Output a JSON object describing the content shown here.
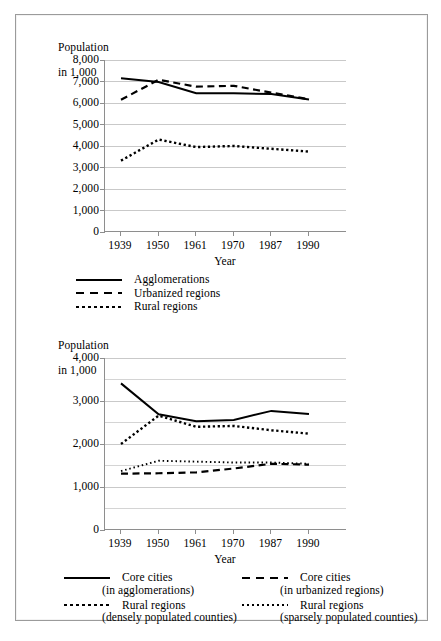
{
  "document": {
    "border_color": "#9b9b9b",
    "background": "#ffffff",
    "ink": "#000000"
  },
  "chart_data": [
    {
      "id": "top",
      "type": "line",
      "title": "",
      "ylabel": "Population\nin 1,000",
      "xlabel": "Year",
      "categories": [
        "1939",
        "1950",
        "1961",
        "1970",
        "1987",
        "1990"
      ],
      "ylim": [
        0,
        8000
      ],
      "yticks": [
        0,
        1000,
        2000,
        3000,
        4000,
        5000,
        6000,
        7000,
        8000
      ],
      "ytick_labels": [
        "0",
        "1,000",
        "2,000",
        "3,000",
        "4,000",
        "5,000",
        "6,000",
        "7,000",
        "8,000"
      ],
      "grid": true,
      "legend_position": "below",
      "series": [
        {
          "name": "Agglomerations",
          "style": "solid",
          "values": [
            7150,
            6980,
            6450,
            6450,
            6420,
            6160
          ]
        },
        {
          "name": "Urbanized regions",
          "style": "dashed",
          "values": [
            6150,
            7080,
            6760,
            6800,
            6480,
            6170
          ]
        },
        {
          "name": "Rural regions",
          "style": "dotted",
          "values": [
            3320,
            4300,
            3950,
            4000,
            3870,
            3740
          ]
        }
      ]
    },
    {
      "id": "bottom",
      "type": "line",
      "title": "",
      "ylabel": "Population\nin 1,000",
      "xlabel": "Year",
      "categories": [
        "1939",
        "1950",
        "1961",
        "1970",
        "1987",
        "1990"
      ],
      "ylim": [
        0,
        4000
      ],
      "yticks": [
        0,
        1000,
        2000,
        3000,
        4000
      ],
      "ytick_labels": [
        "0",
        "1,000",
        "2,000",
        "3,000",
        "4,000"
      ],
      "gridlines_minor": [
        500,
        1500,
        2500,
        3500
      ],
      "grid": true,
      "legend_position": "below",
      "series": [
        {
          "name": "Core cities (in agglomerations)",
          "style": "solid",
          "values": [
            3410,
            2690,
            2530,
            2560,
            2770,
            2700
          ]
        },
        {
          "name": "Core cities (in urbanized regions)",
          "style": "dashed",
          "values": [
            1310,
            1320,
            1340,
            1430,
            1540,
            1520
          ]
        },
        {
          "name": "Rural regions (densely populated counties)",
          "style": "dotted",
          "values": [
            2000,
            2660,
            2400,
            2420,
            2320,
            2240
          ]
        },
        {
          "name": "Rural regions (sparsely populated counties)",
          "style": "finedot",
          "values": [
            1370,
            1610,
            1590,
            1570,
            1570,
            1540
          ]
        }
      ]
    }
  ],
  "top_chart": {
    "ylabel_line1": "Population",
    "ylabel_line2": "in 1,000",
    "xlabel": "Year",
    "ytick_labels": [
      "8,000",
      "7,000",
      "6,000",
      "5,000",
      "4,000",
      "3,000",
      "2,000",
      "1,000",
      "0"
    ],
    "xtick_labels": [
      "1939",
      "1950",
      "1961",
      "1970",
      "1987",
      "1990"
    ],
    "legend": [
      {
        "key": "solid",
        "label": "Agglomerations"
      },
      {
        "key": "dashed",
        "label": "Urbanized regions"
      },
      {
        "key": "dotted",
        "label": "Rural regions"
      }
    ]
  },
  "bottom_chart": {
    "ylabel_line1": "Population",
    "ylabel_line2": "in 1,000",
    "xlabel": "Year",
    "ytick_labels": [
      "4,000",
      "3,000",
      "2,000",
      "1,000",
      "0"
    ],
    "xtick_labels": [
      "1939",
      "1950",
      "1961",
      "1970",
      "1987",
      "1990"
    ],
    "legend": [
      {
        "key": "solid",
        "label": "Core cities",
        "sub": "(in agglomerations)"
      },
      {
        "key": "dashed",
        "label": "Core cities",
        "sub": "(in urbanized regions)"
      },
      {
        "key": "dotted",
        "label": "Rural regions",
        "sub": "(densely populated counties)"
      },
      {
        "key": "finedot",
        "label": "Rural regions",
        "sub": "(sparsely populated counties)"
      }
    ]
  }
}
